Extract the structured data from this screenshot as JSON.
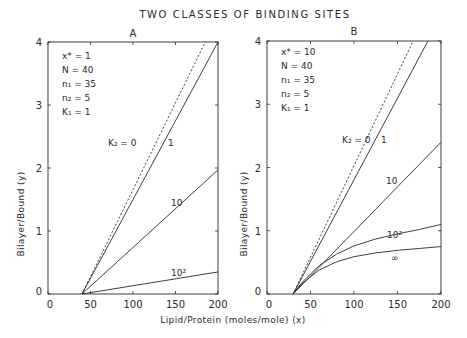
{
  "figure": {
    "title": "TWO CLASSES OF BINDING SITES",
    "xlabel": "Lipid/Protein (moles/mole) (x)",
    "ylabel": "Bilayer/Bound (y)"
  },
  "chart_data": [
    {
      "type": "line",
      "panel": "A",
      "title": "TWO CLASSES OF BINDING SITES",
      "xlabel": "Lipid/Protein (moles/mole) (x)",
      "ylabel": "Bilayer/Bound (y)",
      "xlim": [
        0,
        200
      ],
      "ylim": [
        0,
        4
      ],
      "xticks": [
        0,
        50,
        100,
        150,
        200
      ],
      "yticks": [
        0,
        1,
        2,
        3,
        4
      ],
      "grid": false,
      "parameters": [
        "x* = 1",
        "N = 40",
        "n1 = 35",
        "n2 = 5",
        "K1 = 1"
      ],
      "series": [
        {
          "name": "K2 = 0",
          "style": "dashed",
          "x": [
            40,
            185
          ],
          "y": [
            0,
            4
          ]
        },
        {
          "name": "1",
          "style": "solid",
          "x": [
            40,
            200
          ],
          "y": [
            0,
            4
          ]
        },
        {
          "name": "10",
          "style": "solid",
          "x": [
            40,
            200
          ],
          "y": [
            0,
            1.97
          ]
        },
        {
          "name": "10^2",
          "style": "solid",
          "x": [
            40,
            200
          ],
          "y": [
            0,
            0.35
          ]
        }
      ]
    },
    {
      "type": "line",
      "panel": "B",
      "title": "TWO CLASSES OF BINDING SITES",
      "xlabel": "Lipid/Protein (moles/mole) (x)",
      "ylabel": "Bilayer/Bound (y)",
      "xlim": [
        0,
        200
      ],
      "ylim": [
        0,
        4
      ],
      "xticks": [
        0,
        50,
        100,
        150,
        200
      ],
      "yticks": [
        0,
        1,
        2,
        3,
        4
      ],
      "grid": false,
      "parameters": [
        "x* = 10",
        "N = 40",
        "n1 = 35",
        "n2 = 5",
        "K1 = 1"
      ],
      "series": [
        {
          "name": "K2 = 0",
          "style": "dashed",
          "x": [
            30,
            168
          ],
          "y": [
            0,
            4
          ]
        },
        {
          "name": "1",
          "style": "solid",
          "x": [
            30,
            185
          ],
          "y": [
            0,
            4
          ]
        },
        {
          "name": "10",
          "style": "solid",
          "x": [
            30,
            200
          ],
          "y": [
            0,
            2.4
          ]
        },
        {
          "name": "10^2",
          "style": "solid",
          "x": [
            30,
            40,
            60,
            80,
            100,
            125,
            150,
            175,
            200
          ],
          "y": [
            0,
            0.18,
            0.45,
            0.63,
            0.76,
            0.87,
            0.95,
            1.02,
            1.1
          ]
        },
        {
          "name": "∞",
          "style": "solid",
          "x": [
            30,
            40,
            60,
            80,
            100,
            125,
            150,
            175,
            200
          ],
          "y": [
            0,
            0.16,
            0.38,
            0.51,
            0.59,
            0.65,
            0.69,
            0.72,
            0.75
          ]
        }
      ]
    }
  ],
  "panels": [
    {
      "label": "A",
      "params": [
        "x* = 1",
        "N = 40",
        "n₁ = 35",
        "n₂ = 5",
        "K₁ = 1"
      ],
      "curve_labels": {
        "k2": "K₂ = 0",
        "c1": "1",
        "c10": "10",
        "c100": "10²"
      }
    },
    {
      "label": "B",
      "params": [
        "x* = 10",
        "N = 40",
        "n₁ = 35",
        "n₂ = 5",
        "K₁ = 1"
      ],
      "curve_labels": {
        "k2": "K₂ = 0",
        "c1": "1",
        "c10": "10",
        "c100": "10²",
        "cinf": "∞"
      }
    }
  ],
  "ticks": {
    "x": [
      "0",
      "50",
      "100",
      "150",
      "200"
    ],
    "y": [
      "0",
      "1",
      "2",
      "3",
      "4"
    ]
  },
  "colors": {
    "ink": "#2a2a2a",
    "background": "#ffffff"
  }
}
